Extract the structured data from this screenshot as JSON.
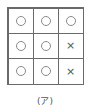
{
  "grid": {
    "rows": [
      [
        "O",
        "O",
        "O"
      ],
      [
        "O",
        "O",
        "X"
      ],
      [
        "O",
        "O",
        "X"
      ]
    ]
  },
  "caption": "(ア)",
  "symbols": {
    "O": "circle-icon",
    "X": "cross-icon"
  }
}
